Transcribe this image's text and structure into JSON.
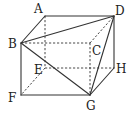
{
  "diagram": {
    "type": "cuboid",
    "vertices": [
      "A",
      "B",
      "C",
      "D",
      "E",
      "F",
      "G",
      "H"
    ],
    "labels": {
      "A": "A",
      "B": "B",
      "C": "C",
      "D": "D",
      "E": "E",
      "F": "F",
      "G": "G",
      "H": "H"
    },
    "visible_edges": [
      [
        "A",
        "D"
      ],
      [
        "A",
        "B"
      ],
      [
        "B",
        "D"
      ],
      [
        "D",
        "H"
      ],
      [
        "H",
        "G"
      ],
      [
        "B",
        "F"
      ],
      [
        "F",
        "G"
      ],
      [
        "B",
        "G"
      ],
      [
        "D",
        "G"
      ]
    ],
    "hidden_edges": [
      [
        "B",
        "C"
      ],
      [
        "C",
        "G"
      ],
      [
        "C",
        "D"
      ],
      [
        "A",
        "E"
      ],
      [
        "E",
        "H"
      ],
      [
        "E",
        "F"
      ]
    ],
    "colors": {
      "line": "#333333",
      "text": "#222222",
      "background": "#ffffff"
    }
  }
}
